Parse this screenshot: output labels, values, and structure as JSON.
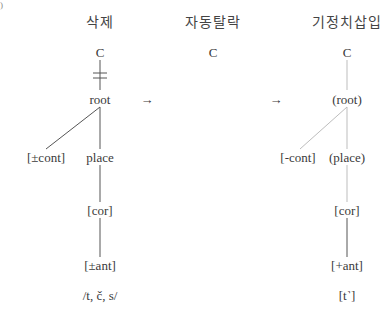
{
  "corner_mark": ")",
  "panels": [
    {
      "title": "삭제",
      "nodes": {
        "c": "C",
        "root": "root",
        "cont": "[±cont]",
        "place": "place",
        "cor": "[cor]",
        "ant": "[±ant]",
        "segments": "/t, č, s/"
      }
    },
    {
      "title": "자동탈락",
      "nodes": {
        "c": "C"
      }
    },
    {
      "title": "기정치삽입",
      "nodes": {
        "c": "C",
        "root": "(root)",
        "cont": "[-cont]",
        "place": "(place)",
        "cor": "[cor]",
        "ant": "[+ant]",
        "segments": "[t˺]"
      }
    }
  ],
  "arrows": [
    "→",
    "→"
  ],
  "colors": {
    "line_dark": "#555555",
    "line_light": "#bdbdbd",
    "text": "#3a3a3a"
  }
}
